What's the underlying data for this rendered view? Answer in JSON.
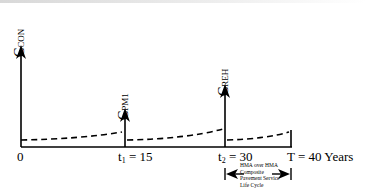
{
  "diagram": {
    "type": "life-cycle cost timeline",
    "vertical_labels": {
      "construction": {
        "main": "C",
        "sub": "CON"
      },
      "maintenance": {
        "main": "C",
        "sub": "PM1"
      },
      "rehabilitation": {
        "main": "C",
        "sub": "REH"
      }
    },
    "axis_labels": {
      "origin": "0",
      "t1": {
        "var": "t",
        "sub": "1",
        "rest": " = 15"
      },
      "t2": {
        "var": "t",
        "sub": "2",
        "rest": " = 30"
      },
      "end": "T = 40 Years"
    },
    "annotation": {
      "lines": [
        "HMA over HMA",
        "Composite",
        "Pavement Service",
        "Life Cycle"
      ]
    },
    "colors": {
      "line": "#000000",
      "background": "#ffffff"
    }
  }
}
